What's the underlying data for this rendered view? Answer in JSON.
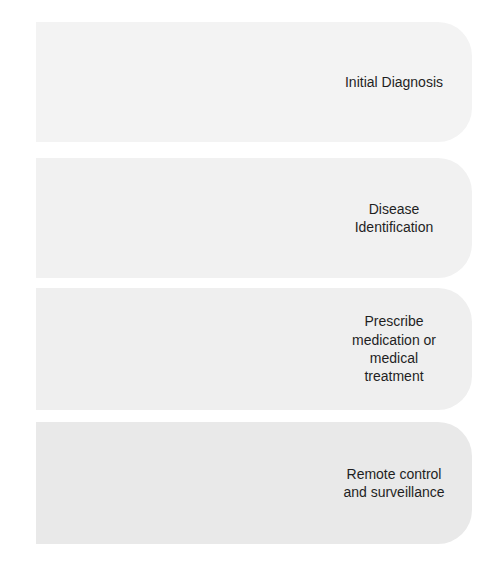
{
  "diagram": {
    "type": "chevron-process",
    "text_color": "#1f1f1f",
    "chevron_text_color": "#ffffff",
    "background": "#ffffff",
    "steps": [
      {
        "id": "primary-care",
        "stage_label": "Primary\ncare",
        "description": "Initial Diagnosis",
        "chevron_color": "#e2e2e2",
        "band_color": "#f3f3f3"
      },
      {
        "id": "specialty-care",
        "stage_label": "Specialty\ncare",
        "description": "Disease\nIdentification",
        "chevron_color": "#c6c6c6",
        "band_color": "#f1f1f1"
      },
      {
        "id": "emergency-care",
        "stage_label": "Emergency\ncare",
        "description": "Prescribe\nmedication or\nmedical\ntreatment",
        "chevron_color": "#b2b2b2",
        "band_color": "#efefef"
      },
      {
        "id": "long-term-care",
        "stage_label": "Long term\ncare",
        "description": "Remote control\nand surveillance",
        "chevron_color": "#8d8d8d",
        "band_color": "#e9e9e9"
      }
    ]
  }
}
